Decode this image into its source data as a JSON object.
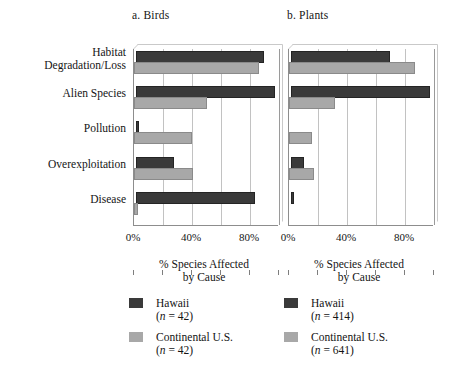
{
  "chart_data": [
    {
      "type": "bar",
      "title": "a. Birds",
      "orientation": "horizontal",
      "xlabel": "% Species Affected by Cause",
      "ylabel": "",
      "xlim": [
        0,
        100
      ],
      "xticks": [
        0,
        20,
        40,
        60,
        80,
        100
      ],
      "xticklabels": [
        "0%",
        "",
        "40%",
        "",
        "80%",
        ""
      ],
      "grid": true,
      "legend_position": "bottom",
      "categories": [
        "Habitat Degradation/Loss",
        "Alien Species",
        "Pollution",
        "Overexploitation",
        "Disease"
      ],
      "series": [
        {
          "name": "Hawaii",
          "n": 42,
          "color": "#3a3a3a",
          "values": [
            88,
            96,
            2,
            26,
            82
          ]
        },
        {
          "name": "Continental U.S.",
          "n": 42,
          "color": "#a8a8a8",
          "values": [
            86,
            50,
            40,
            41,
            3
          ]
        }
      ]
    },
    {
      "type": "bar",
      "title": "b. Plants",
      "orientation": "horizontal",
      "xlabel": "% Species Affected by Cause",
      "ylabel": "",
      "xlim": [
        0,
        100
      ],
      "xticks": [
        0,
        20,
        40,
        60,
        80,
        100
      ],
      "xticklabels": [
        "0%",
        "",
        "40%",
        "",
        "80%",
        ""
      ],
      "grid": true,
      "legend_position": "bottom",
      "categories": [
        "Habitat Degradation/Loss",
        "Alien Species",
        "Pollution",
        "Overexploitation",
        "Disease"
      ],
      "series": [
        {
          "name": "Hawaii",
          "n": 414,
          "color": "#3a3a3a",
          "values": [
            68,
            96,
            0,
            9,
            2
          ]
        },
        {
          "name": "Continental U.S.",
          "n": 641,
          "color": "#a8a8a8",
          "values": [
            87,
            32,
            16,
            17,
            0
          ]
        }
      ]
    }
  ],
  "categories": [
    {
      "line1": "Habitat",
      "line2": "Degradation/Loss"
    },
    {
      "line1": "Alien Species",
      "line2": ""
    },
    {
      "line1": "Pollution",
      "line2": ""
    },
    {
      "line1": "Overexploitation",
      "line2": ""
    },
    {
      "line1": "Disease",
      "line2": ""
    }
  ],
  "panels": [
    {
      "id": "a",
      "title": "a. Birds",
      "caption_line1": "% Species Affected",
      "caption_line2": "by Cause",
      "xticklabels": [
        {
          "value": 0,
          "text": "0%"
        },
        {
          "value": 20,
          "text": ""
        },
        {
          "value": 40,
          "text": "40%"
        },
        {
          "value": 60,
          "text": ""
        },
        {
          "value": 80,
          "text": "80%"
        },
        {
          "value": 100,
          "text": ""
        }
      ],
      "legend": [
        {
          "label": "Hawaii",
          "n_text": "(n = 42)",
          "n_prefix": "(",
          "n_italic": "n",
          "n_suffix": " = 42)",
          "swatch": "dark"
        },
        {
          "label": "Continental U.S.",
          "n_text": "(n = 42)",
          "n_prefix": "(",
          "n_italic": "n",
          "n_suffix": " = 42)",
          "swatch": "light"
        }
      ]
    },
    {
      "id": "b",
      "title": "b. Plants",
      "caption_line1": "% Species Affected",
      "caption_line2": "by Cause",
      "xticklabels": [
        {
          "value": 0,
          "text": "0%"
        },
        {
          "value": 20,
          "text": ""
        },
        {
          "value": 40,
          "text": "40%"
        },
        {
          "value": 60,
          "text": ""
        },
        {
          "value": 80,
          "text": "80%"
        },
        {
          "value": 100,
          "text": ""
        }
      ],
      "legend": [
        {
          "label": "Hawaii",
          "n_text": "(n = 414)",
          "n_prefix": "(",
          "n_italic": "n",
          "n_suffix": " = 414)",
          "swatch": "dark"
        },
        {
          "label": "Continental U.S.",
          "n_text": "(n = 641)",
          "n_prefix": "(",
          "n_italic": "n",
          "n_suffix": " = 641)",
          "swatch": "light"
        }
      ]
    }
  ],
  "colors": {
    "hawaii": "#3a3a3a",
    "continental": "#a8a8a8",
    "axis": "#8d8d8d",
    "grid": "#c2c2c2",
    "text": "#141414",
    "background": "#ffffff"
  }
}
